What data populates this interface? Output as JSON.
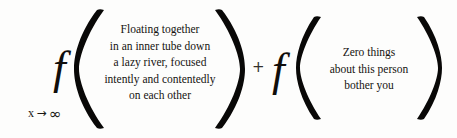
{
  "equation": {
    "limit": {
      "variable": "x",
      "arrow": "→",
      "target": "∞",
      "full": "x → ∞"
    },
    "operator_plus": "+",
    "terms": [
      {
        "function_symbol": "f",
        "open_paren": "(",
        "close_paren": ")",
        "argument_lines": [
          "Floating together",
          "in an inner tube down",
          "a lazy river, focused",
          "intently and contentedly",
          "on each other"
        ]
      },
      {
        "function_symbol": "f",
        "open_paren": "(",
        "close_paren": ")",
        "argument_lines": [
          "Zero things",
          "about this person",
          "bother you"
        ]
      }
    ]
  },
  "colors": {
    "background": "#fdfdfc",
    "ink": "#151310",
    "paren_ink": "#090807"
  }
}
